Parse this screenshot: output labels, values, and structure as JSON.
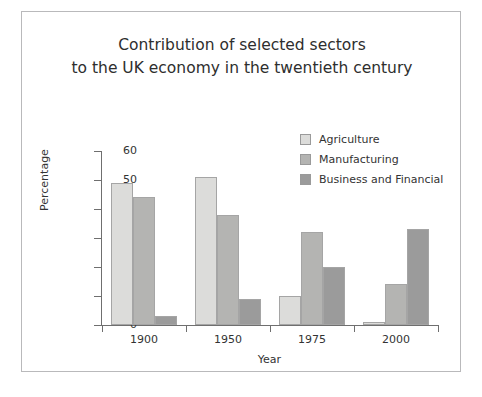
{
  "scan_artifact_text": "",
  "chart_data": {
    "type": "bar",
    "title_line1": "Contribution of selected sectors",
    "title_line2": "to the UK economy in the twentieth century",
    "xlabel": "Year",
    "ylabel": "Percentage",
    "categories": [
      "1900",
      "1950",
      "1975",
      "2000"
    ],
    "ylim": [
      0,
      60
    ],
    "yticks": [
      0,
      10,
      20,
      30,
      40,
      50,
      60
    ],
    "grid": false,
    "legend_position": "top-right",
    "series": [
      {
        "name": "Agriculture",
        "color": "#dcdcda",
        "values": [
          49,
          51,
          10,
          1
        ]
      },
      {
        "name": "Manufacturing",
        "color": "#b4b4b2",
        "values": [
          44,
          38,
          32,
          14
        ]
      },
      {
        "name": "Business and Financial",
        "color": "#9b9b9b",
        "values": [
          3,
          9,
          20,
          33
        ]
      }
    ]
  }
}
